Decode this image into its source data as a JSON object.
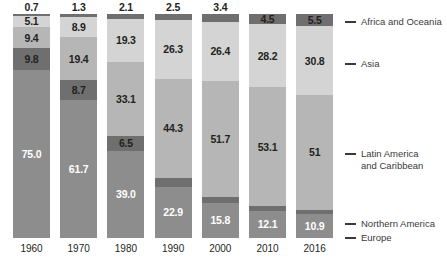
{
  "chart_data": {
    "type": "bar",
    "subtype": "100% stacked column",
    "title": "",
    "subtitle": "",
    "xlabel": "",
    "ylabel": "",
    "ylim": [
      0,
      100
    ],
    "grid": false,
    "legend_position": "right",
    "categories": [
      "1960",
      "1970",
      "1980",
      "1990",
      "2000",
      "2010",
      "2016"
    ],
    "series": [
      {
        "name": "Africa and Oceania",
        "color": "#6f6f6f",
        "values": [
          0.7,
          1.3,
          2.1,
          2.5,
          3.4,
          4.5,
          5.5
        ],
        "labels": [
          "0.7",
          "1.3",
          "2.1",
          "2.5",
          "3.4",
          "4.5",
          "5.5"
        ],
        "label_placement": [
          "above",
          "above",
          "above",
          "above",
          "above",
          "inside",
          "inside"
        ]
      },
      {
        "name": "Asia",
        "color": "#d4d4d4",
        "values": [
          5.1,
          8.9,
          19.3,
          26.3,
          26.4,
          28.2,
          30.8
        ],
        "labels": [
          "5.1",
          "8.9",
          "19.3",
          "26.3",
          "26.4",
          "28.2",
          "30.8"
        ],
        "label_placement": [
          "inside",
          "inside",
          "inside",
          "inside",
          "inside",
          "inside",
          "inside"
        ]
      },
      {
        "name": "Latin America and Caribbean",
        "color": "#b6b6b6",
        "values": [
          9.4,
          19.4,
          33.1,
          44.3,
          51.7,
          53.1,
          51.0
        ],
        "labels": [
          "9.4",
          "19.4",
          "33.1",
          "44.3",
          "51.7",
          "53.1",
          "51"
        ],
        "label_placement": [
          "inside",
          "inside",
          "inside",
          "inside",
          "inside",
          "inside",
          "inside"
        ]
      },
      {
        "name": "Northern America",
        "color": "#6f6f6f",
        "values": [
          9.8,
          8.7,
          6.5,
          4.0,
          2.7,
          2.0,
          1.8
        ],
        "labels": [
          "9.8",
          "8.7",
          "6.5",
          "4.0",
          "2.7",
          "2",
          "1.8"
        ],
        "label_placement": [
          "inside",
          "inside",
          "inside",
          "above",
          "above",
          "above",
          "above"
        ]
      },
      {
        "name": "Europe",
        "color": "#8d8d8d",
        "values": [
          75.0,
          61.7,
          39.0,
          22.9,
          15.8,
          12.1,
          10.9
        ],
        "labels": [
          "75.0",
          "61.7",
          "39.0",
          "22.9",
          "15.8",
          "12.1",
          "10.9"
        ],
        "label_placement": [
          "inside",
          "inside",
          "inside",
          "inside",
          "inside",
          "inside",
          "inside"
        ]
      }
    ]
  },
  "legend": {
    "items": [
      {
        "label": "Africa and Oceania"
      },
      {
        "label": "Asia"
      },
      {
        "label": "Latin America\nand Caribbean"
      },
      {
        "label": "Northern America"
      },
      {
        "label": "Europe"
      }
    ]
  },
  "axis": {
    "x_ticks": [
      "1960",
      "1970",
      "1980",
      "1990",
      "2000",
      "2010",
      "2016"
    ]
  }
}
